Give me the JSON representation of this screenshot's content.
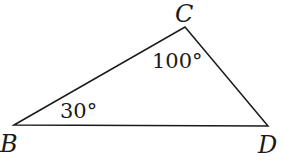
{
  "diagram": {
    "type": "triangle",
    "vertices": [
      {
        "label": "B",
        "x": 14,
        "y": 125
      },
      {
        "label": "C",
        "x": 185,
        "y": 27
      },
      {
        "label": "D",
        "x": 268,
        "y": 126
      }
    ],
    "angles": [
      {
        "at": "C",
        "label": "100°"
      },
      {
        "at": "B",
        "label": "30°"
      }
    ],
    "stroke_color": "#1a1a1a"
  }
}
